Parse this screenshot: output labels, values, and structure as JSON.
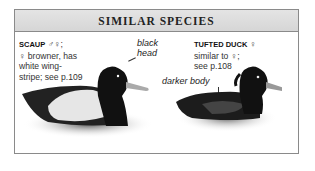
{
  "header": {
    "title": "SIMILAR SPECIES"
  },
  "scaup": {
    "name": "SCAUP",
    "sex_symbols": "♂♀;",
    "line1": "♀ browner, has",
    "line2": "white wing-",
    "line3": "stripe; see p.109",
    "male_marker": "♂",
    "annotation_line1": "black",
    "annotation_line2": "head"
  },
  "tufted": {
    "name": "TUFTED DUCK",
    "sex_symbols": "♀",
    "line1": "similar to ♀;",
    "line2": "see p.108",
    "annotation": "darker body"
  }
}
